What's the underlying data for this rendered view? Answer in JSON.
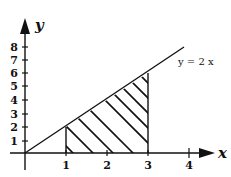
{
  "diagram": {
    "type": "area-under-line",
    "x_axis": {
      "label": "x",
      "ticks": [
        "1",
        "2",
        "3",
        "4"
      ]
    },
    "y_axis": {
      "label": "y",
      "ticks": [
        "1",
        "2",
        "3",
        "4",
        "5",
        "6",
        "7",
        "8"
      ]
    },
    "line": {
      "equation": "y = 2x",
      "label": "y = 2 x"
    },
    "shaded_region": {
      "from_x": 1,
      "to_x": 3,
      "bounded_above_by": "y = 2x",
      "bounded_below_by": "x-axis",
      "fill": "diagonal hatch"
    },
    "colors": {
      "ink": "#111111",
      "background": "#ffffff"
    }
  }
}
